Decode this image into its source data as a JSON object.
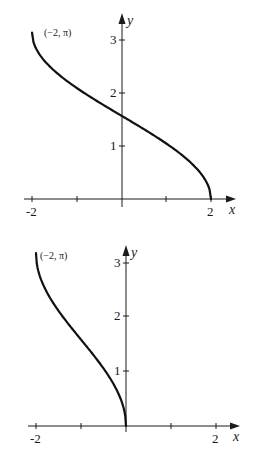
{
  "chart_data": [
    {
      "type": "line",
      "title": "",
      "xlabel": "x",
      "ylabel": "y",
      "xlim": [
        -2,
        2
      ],
      "ylim": [
        0,
        3.3
      ],
      "grid": false,
      "x_ticks": [
        -2,
        -1,
        0,
        1,
        2
      ],
      "x_tick_labels": [
        "-2",
        "2"
      ],
      "y_ticks": [
        1,
        2,
        3
      ],
      "y_tick_labels": [
        "1",
        "2",
        "3"
      ],
      "annotations": [
        {
          "text": "(−2, π)",
          "x": -2,
          "y": 3.14159
        }
      ],
      "series": [
        {
          "name": "y = arccos(x/2)",
          "x": [
            -2,
            -1.5,
            -1,
            -0.5,
            0,
            0.5,
            1,
            1.5,
            2
          ],
          "y": [
            3.14,
            2.42,
            2.09,
            1.82,
            1.57,
            1.32,
            1.05,
            0.72,
            0
          ]
        }
      ]
    },
    {
      "type": "line",
      "title": "",
      "xlabel": "x",
      "ylabel": "y",
      "xlim": [
        -2,
        2
      ],
      "ylim": [
        0,
        3.3
      ],
      "grid": false,
      "x_ticks": [
        -2,
        -1,
        0,
        1,
        2
      ],
      "x_tick_labels": [
        "-2",
        "2"
      ],
      "y_ticks": [
        1,
        2,
        3
      ],
      "y_tick_labels": [
        "1",
        "2",
        "3"
      ],
      "annotations": [
        {
          "text": "(−2, π)",
          "x": -2,
          "y": 3.14159
        }
      ],
      "series": [
        {
          "name": "y = arccos(x+1)",
          "x": [
            -2,
            -1.75,
            -1.5,
            -1.25,
            -1,
            -0.75,
            -0.5,
            -0.25,
            0
          ],
          "y": [
            3.14,
            2.42,
            2.09,
            1.82,
            1.57,
            1.32,
            1.05,
            0.72,
            0
          ]
        }
      ]
    }
  ],
  "graph1": {
    "x_axis_label": "x",
    "y_axis_label": "y",
    "x_tick_neg2": "-2",
    "x_tick_2": "2",
    "y_tick_1": "1",
    "y_tick_2": "2",
    "y_tick_3": "3",
    "point_label": "(−2, π)"
  },
  "graph2": {
    "x_axis_label": "x",
    "y_axis_label": "y",
    "x_tick_neg2": "-2",
    "x_tick_2": "2",
    "y_tick_1": "1",
    "y_tick_2": "2",
    "y_tick_3": "3",
    "point_label": "(−2, π)"
  }
}
